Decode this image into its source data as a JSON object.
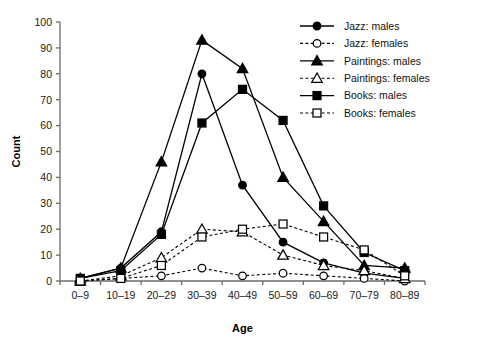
{
  "chart_data": {
    "type": "line",
    "title": "",
    "xlabel": "Age",
    "ylabel": "Count",
    "categories": [
      "0–9",
      "10–19",
      "20–29",
      "30–39",
      "40–49",
      "50–59",
      "60–69",
      "70–79",
      "80–89"
    ],
    "ylim": [
      0,
      100
    ],
    "yticks": [
      0,
      10,
      20,
      30,
      40,
      50,
      60,
      70,
      80,
      90,
      100
    ],
    "ytick_labels": [
      "0",
      "10",
      "20",
      "30",
      "40",
      "50",
      "60",
      "70",
      "80",
      "90",
      "100"
    ],
    "grid": false,
    "legend_position": "upper-right-outside",
    "series": [
      {
        "name": "Jazz: males",
        "marker": "filled-circle",
        "line": "solid",
        "values": [
          1,
          5,
          19,
          80,
          37,
          15,
          7,
          3,
          1
        ]
      },
      {
        "name": "Jazz: females",
        "marker": "open-circle",
        "line": "dashed",
        "values": [
          0,
          1,
          2,
          5,
          2,
          3,
          2,
          1,
          0
        ]
      },
      {
        "name": "Paintings: males",
        "marker": "filled-triangle",
        "line": "solid",
        "values": [
          1,
          5,
          46,
          93,
          82,
          40,
          23,
          6,
          5
        ]
      },
      {
        "name": "Paintings: females",
        "marker": "open-triangle",
        "line": "dashed",
        "values": [
          0,
          2,
          9,
          20,
          19,
          10,
          6,
          4,
          1
        ]
      },
      {
        "name": "Books: males",
        "marker": "filled-square",
        "line": "solid",
        "values": [
          1,
          4,
          18,
          61,
          74,
          62,
          29,
          11,
          4
        ]
      },
      {
        "name": "Books: females",
        "marker": "open-square",
        "line": "dashed",
        "values": [
          0,
          1,
          6,
          17,
          20,
          22,
          17,
          12,
          2
        ]
      }
    ],
    "colors": {
      "line": "#000000",
      "axis": "#6b6b6b",
      "text": "#000000",
      "background": "#ffffff"
    }
  },
  "legend": {
    "items": [
      {
        "label": "Jazz: males"
      },
      {
        "label": "Jazz: females"
      },
      {
        "label": "Paintings: males"
      },
      {
        "label": "Paintings: females"
      },
      {
        "label": "Books: males"
      },
      {
        "label": "Books: females"
      }
    ]
  }
}
